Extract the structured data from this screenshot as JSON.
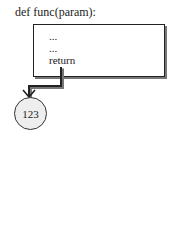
{
  "diagram": {
    "title": "def func(param):",
    "body_lines": [
      "...",
      "...",
      "return"
    ],
    "result": "123"
  },
  "colors": {
    "stroke": "#222222",
    "shadow": "#777777",
    "circle_fill": "#eeeeee",
    "background": "#ffffff"
  }
}
